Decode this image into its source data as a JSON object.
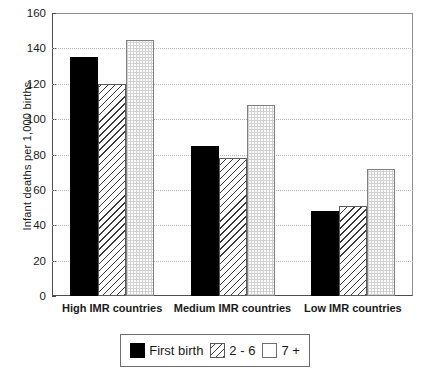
{
  "chart_data": {
    "type": "bar",
    "title": "",
    "xlabel": "",
    "ylabel": "Infant deaths per 1,000 births",
    "categories": [
      "High IMR countries",
      "Medium IMR countries",
      "Low IMR countries"
    ],
    "series": [
      {
        "name": "First birth",
        "values": [
          135,
          85,
          48
        ],
        "pattern": "solid-black"
      },
      {
        "name": "2 - 6",
        "values": [
          120,
          78,
          51
        ],
        "pattern": "diagonal-hatch"
      },
      {
        "name": "7 +",
        "values": [
          145,
          108,
          72
        ],
        "pattern": "fine-grid"
      }
    ],
    "ylim": [
      0,
      160
    ],
    "yticks": [
      0,
      20,
      40,
      60,
      80,
      100,
      120,
      140,
      160
    ],
    "ytick_labels": [
      "0",
      "20",
      "40",
      "60",
      "80",
      "100",
      "120",
      "140",
      "160"
    ],
    "grid": true,
    "grid_axis": "y",
    "grid_style": "dotted",
    "legend_position": "bottom-center",
    "colors": {
      "series_first": "#000000",
      "series_mid": "#3a3a3a",
      "series_last": "#d2d2d2",
      "axis": "#4d4d4d",
      "grid": "#b5b5b5",
      "background": "#ffffff"
    }
  },
  "legend": {
    "entries": [
      {
        "label": "First birth"
      },
      {
        "label": "2 - 6"
      },
      {
        "label": "7 +"
      }
    ]
  }
}
